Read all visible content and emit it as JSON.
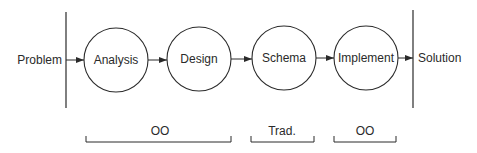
{
  "diagram": {
    "type": "process-flow",
    "start_label": "Problem",
    "end_label": "Solution",
    "stages": [
      {
        "label": "Analysis"
      },
      {
        "label": "Design"
      },
      {
        "label": "Schema"
      },
      {
        "label": "Implement"
      }
    ],
    "groups": [
      {
        "label": "OO",
        "spans": [
          "Analysis",
          "Design"
        ]
      },
      {
        "label": "Trad.",
        "spans": [
          "Schema"
        ]
      },
      {
        "label": "OO",
        "spans": [
          "Implement"
        ]
      }
    ],
    "colors": {
      "stroke": "#2a2a2a",
      "background": "#ffffff"
    }
  }
}
